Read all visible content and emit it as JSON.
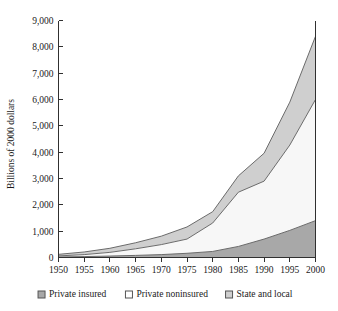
{
  "chart_data": {
    "type": "area",
    "stacked": true,
    "title": "",
    "subtitle": "",
    "xlabel": "",
    "ylabel": "Billions of 2000 dollars",
    "x": [
      1950,
      1955,
      1960,
      1965,
      1970,
      1975,
      1980,
      1985,
      1990,
      1995,
      2000
    ],
    "categories": [
      "1950",
      "1955",
      "1960",
      "1965",
      "1970",
      "1975",
      "1980",
      "1985",
      "1990",
      "1995",
      "2000"
    ],
    "xlim": [
      1950,
      2000
    ],
    "ylim": [
      0,
      9000
    ],
    "yticks": [
      0,
      1000,
      2000,
      3000,
      4000,
      5000,
      6000,
      7000,
      8000,
      9000
    ],
    "ytick_labels": [
      "0",
      "1,000",
      "2,000",
      "3,000",
      "4,000",
      "5,000",
      "6,000",
      "7,000",
      "8,000",
      "9,000"
    ],
    "xticks": [
      1950,
      1955,
      1960,
      1965,
      1970,
      1975,
      1980,
      1985,
      1990,
      1995,
      2000
    ],
    "xtick_labels": [
      "1950",
      "1955",
      "1960",
      "1965",
      "1970",
      "1975",
      "1980",
      "1985",
      "1990",
      "1995",
      "2000"
    ],
    "grid": false,
    "legend_position": "bottom",
    "series": [
      {
        "name": "Private insured",
        "color": "#a8a8a8",
        "values": [
          20,
          35,
          55,
          80,
          110,
          160,
          230,
          420,
          700,
          1030,
          1400
        ]
      },
      {
        "name": "Private noninsured",
        "color": "#f7f7f7",
        "values": [
          40,
          75,
          140,
          250,
          380,
          540,
          1080,
          2060,
          2200,
          3240,
          4600
        ]
      },
      {
        "name": "State and local",
        "color": "#cfcfcf",
        "values": [
          60,
          100,
          155,
          230,
          320,
          460,
          430,
          620,
          1060,
          1630,
          2400
        ]
      }
    ],
    "cumulative_totals": [
      120,
      210,
      350,
      560,
      810,
      1160,
      1740,
      3100,
      3960,
      5900,
      8400
    ]
  },
  "legend": {
    "items": [
      {
        "label": "Private insured",
        "color": "#a8a8a8"
      },
      {
        "label": "Private noninsured",
        "color": "#ffffff"
      },
      {
        "label": "State and local",
        "color": "#cfcfcf"
      }
    ]
  },
  "axes": {
    "y_title": "Billions of 2000 dollars"
  }
}
